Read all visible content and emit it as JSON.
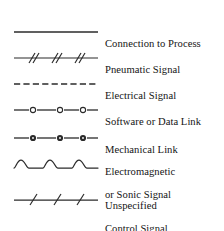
{
  "legend": {
    "title": "Instrument Line Symbols Legend",
    "line_color": "#2b2b2b",
    "text_color": "#141414",
    "background_color": "#ffffff",
    "rows": [
      {
        "symbol": "solid-line",
        "label": "Connection to Process",
        "label_lines": [
          "Connection to Process"
        ]
      },
      {
        "symbol": "double-slash-line",
        "label": "Pneumatic Signal",
        "label_lines": [
          "Pneumatic Signal"
        ]
      },
      {
        "symbol": "dashed-line",
        "label": "Electrical Signal",
        "label_lines": [
          "Electrical Signal"
        ]
      },
      {
        "symbol": "hollow-circle-line",
        "label": "Software or Data Link",
        "label_lines": [
          "Software or Data Link"
        ]
      },
      {
        "symbol": "filled-circle-line",
        "label": "Mechanical Link",
        "label_lines": [
          "Mechanical Link"
        ]
      },
      {
        "symbol": "wavy-line",
        "label": "Electromagnetic or Sonic Signal",
        "label_lines": [
          "Electromagnetic",
          "or Sonic Signal"
        ]
      },
      {
        "symbol": "single-slash-line",
        "label": "Unspecified Control Signal",
        "label_lines": [
          "Unspecified",
          "Control Signal"
        ]
      }
    ]
  }
}
